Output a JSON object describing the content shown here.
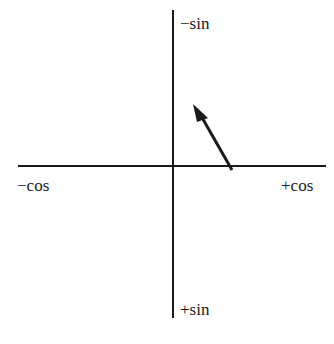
{
  "diagram": {
    "type": "unit-circle-axes",
    "axes": {
      "vertical": {
        "top_label": "−sin",
        "bottom_label": "+sin"
      },
      "horizontal": {
        "left_label": "−cos",
        "right_label": "+cos"
      }
    },
    "arrow": {
      "direction": "up-left",
      "quadrant": "upper-right",
      "from": [
        232,
        170
      ],
      "to": [
        193,
        106
      ]
    },
    "colors": {
      "line": "#1a1a1a",
      "background": "#ffffff"
    }
  }
}
